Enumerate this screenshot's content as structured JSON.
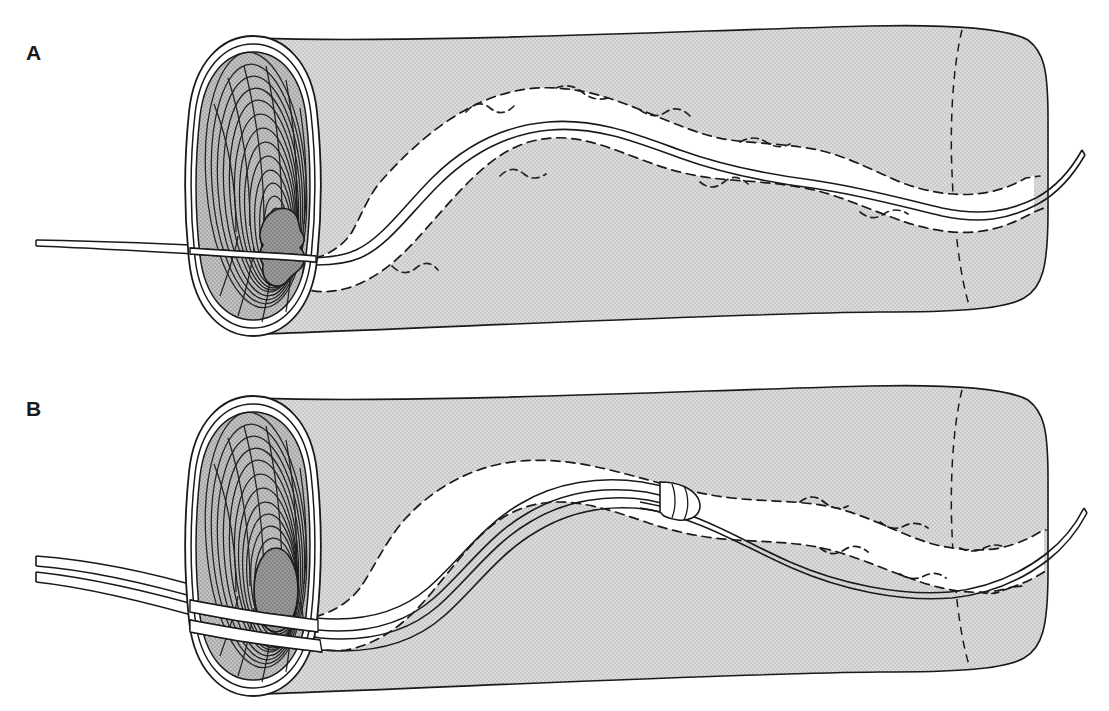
{
  "figure": {
    "title": "",
    "type": "medical-line-illustration",
    "background_color": "#ffffff",
    "ink_color": "#1a1a1a",
    "wall_fill_color": "#d2d2d2",
    "ostium_fill_color": "#b4b4b4",
    "lumen_fill_color": "#8c8c8c",
    "lumen_channel_color": "#ffffff",
    "device_fill_color": "#ffffff"
  },
  "panels": [
    {
      "id": "panel-a",
      "label": "A",
      "label_position": {
        "x": 26,
        "y": 42
      },
      "caption": "",
      "elements": {
        "tube_name": "tubular-organ-cutaway",
        "ostium_name": "proximal-ostium-cross-section",
        "stenotic_lumen_name": "stenotic-lumen-outline",
        "devices": [
          {
            "name": "guidewire",
            "kind": "guidewire",
            "line_count": 2,
            "tip_present": false
          }
        ],
        "residual_lumen_shape": "irregular-slit",
        "concentric_ring_count": 13
      }
    },
    {
      "id": "panel-b",
      "label": "B",
      "label_position": {
        "x": 26,
        "y": 398
      },
      "caption": "",
      "elements": {
        "tube_name": "tubular-organ-cutaway",
        "ostium_name": "proximal-ostium-cross-section",
        "stenotic_lumen_name": "dilated-lumen-outline",
        "devices": [
          {
            "name": "guidewire",
            "kind": "guidewire",
            "line_count": 2,
            "tip_present": false
          },
          {
            "name": "catheter",
            "kind": "catheter-over-wire",
            "line_count": 4,
            "tip_present": true,
            "tip_name": "catheter-tip-hub"
          }
        ],
        "residual_lumen_shape": "smooth-oval",
        "concentric_ring_count": 13
      }
    }
  ]
}
